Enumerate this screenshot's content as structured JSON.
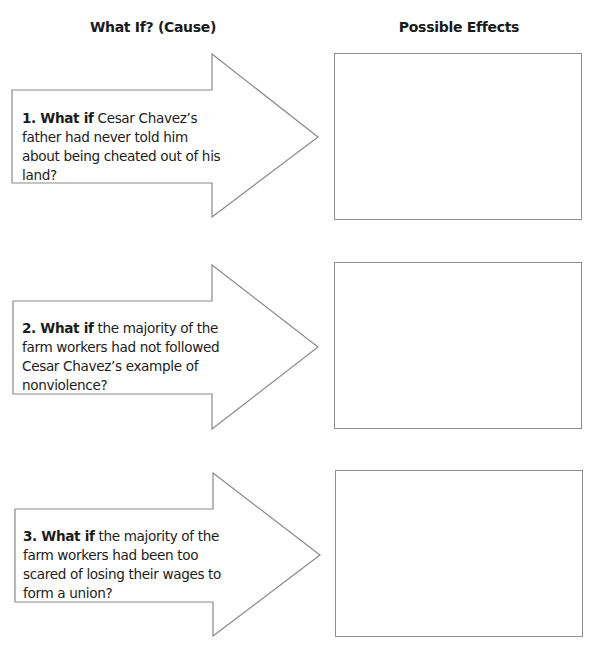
{
  "headers": {
    "cause": "What If? (Cause)",
    "effects": "Possible Effects"
  },
  "rows": [
    {
      "number_label": "1. What if",
      "question": " Cesar Chavez’s father had never told him about being cheated out of his land?",
      "effect_value": ""
    },
    {
      "number_label": "2. What if",
      "question": " the majority of the farm workers had not followed Cesar Chavez’s example of nonviolence?",
      "effect_value": ""
    },
    {
      "number_label": "3. What if",
      "question": " the majority of the farm workers had been too scared of losing their wages to form a union?",
      "effect_value": ""
    }
  ],
  "colors": {
    "stroke": "#8a8a8a",
    "text": "#1a1a1a",
    "background": "#ffffff"
  }
}
